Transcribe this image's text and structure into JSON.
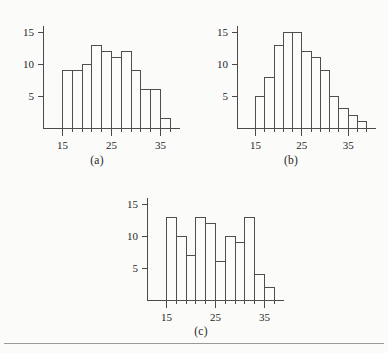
{
  "figure": {
    "background_color": "#fbfbf9",
    "line_color": "#4a4a4a",
    "bar_stroke_color": "#4f4f4f",
    "divider_color": "#9a9a9a"
  },
  "captions": {
    "a": "(a)",
    "b": "(b)",
    "c": "(c)"
  },
  "chart_data": [
    {
      "type": "bar",
      "panel": "(a)",
      "title": "",
      "xlabel": "",
      "ylabel": "",
      "grid": false,
      "legend": null,
      "bin_width": 2,
      "bin_starts": [
        15,
        17,
        19,
        21,
        23,
        25,
        27,
        29,
        31,
        33,
        35
      ],
      "categories": [
        "15-17",
        "17-19",
        "19-21",
        "21-23",
        "23-25",
        "25-27",
        "27-29",
        "29-31",
        "31-33",
        "33-35",
        "35-37"
      ],
      "values": [
        9,
        9,
        10,
        13,
        12,
        11,
        12,
        9,
        6,
        6,
        1.5
      ],
      "xlim": [
        11,
        39
      ],
      "ylim": [
        0,
        16
      ],
      "xticks": [
        15,
        25,
        35
      ],
      "xtick_labels": [
        "15",
        "25",
        "35"
      ],
      "yticks": [
        5,
        10,
        15
      ],
      "ytick_labels": [
        "5",
        "10",
        "15"
      ]
    },
    {
      "type": "bar",
      "panel": "(b)",
      "title": "",
      "xlabel": "",
      "ylabel": "",
      "grid": false,
      "legend": null,
      "bin_width": 2,
      "bin_starts": [
        15,
        17,
        19,
        21,
        23,
        25,
        27,
        29,
        31,
        33,
        35,
        37
      ],
      "categories": [
        "15-17",
        "17-19",
        "19-21",
        "21-23",
        "23-25",
        "25-27",
        "27-29",
        "29-31",
        "31-33",
        "33-35",
        "35-37",
        "37-39"
      ],
      "values": [
        5,
        8,
        13,
        15,
        15,
        12,
        11,
        9,
        5,
        3,
        2,
        1
      ],
      "xlim": [
        11,
        41
      ],
      "ylim": [
        0,
        16
      ],
      "xticks": [
        15,
        25,
        35
      ],
      "xtick_labels": [
        "15",
        "25",
        "35"
      ],
      "yticks": [
        5,
        10,
        15
      ],
      "ytick_labels": [
        "5",
        "10",
        "15"
      ]
    },
    {
      "type": "bar",
      "panel": "(c)",
      "title": "",
      "xlabel": "",
      "ylabel": "",
      "grid": false,
      "legend": null,
      "bin_width": 2,
      "bin_starts": [
        15,
        17,
        19,
        21,
        23,
        25,
        27,
        29,
        31,
        33,
        35
      ],
      "categories": [
        "15-17",
        "17-19",
        "19-21",
        "21-23",
        "23-25",
        "25-27",
        "27-29",
        "29-31",
        "31-33",
        "33-35",
        "35-37"
      ],
      "values": [
        13,
        10,
        7,
        13,
        12,
        6,
        10,
        9,
        13,
        4,
        2
      ],
      "xlim": [
        11,
        39
      ],
      "ylim": [
        0,
        16
      ],
      "xticks": [
        15,
        25,
        35
      ],
      "xtick_labels": [
        "15",
        "25",
        "35"
      ],
      "yticks": [
        5,
        10,
        15
      ],
      "ytick_labels": [
        "5",
        "10",
        "15"
      ]
    }
  ]
}
